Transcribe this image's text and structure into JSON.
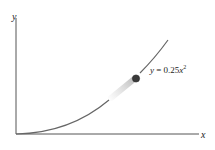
{
  "diagram": {
    "x_axis_label": "x",
    "y_axis_label": "y",
    "equation": {
      "prefix": "y",
      "equals": " = 0.25",
      "var": "x",
      "exponent": "2"
    },
    "curve": "y = 0.25x^2",
    "ball": "particle moving along the parabola",
    "colors": {
      "axis": "#555555",
      "curve": "#666666",
      "ball": "#3a3a3a"
    }
  }
}
